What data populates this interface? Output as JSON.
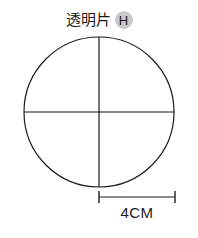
{
  "page": {
    "background_color": "#ffffff",
    "width": 198,
    "height": 238
  },
  "title": {
    "text": "透明片",
    "badge_letter": "H",
    "badge_color": "#c9c9c9",
    "text_color": "#1a1a1a"
  },
  "figure": {
    "shape": "circle",
    "stroke_color": "#1a1a1a",
    "fill": "none",
    "center_x": 99,
    "center_y": 112,
    "radius": 75,
    "diameter_cm": 4,
    "guides": [
      {
        "name": "vertical-diameter",
        "orientation": "vertical"
      },
      {
        "name": "horizontal-diameter",
        "orientation": "horizontal"
      }
    ]
  },
  "dimension": {
    "label": "4CM",
    "value": 4,
    "unit": "CM",
    "measures": "radius",
    "line_start_x": 99,
    "line_end_x": 175,
    "line_y": 197
  }
}
